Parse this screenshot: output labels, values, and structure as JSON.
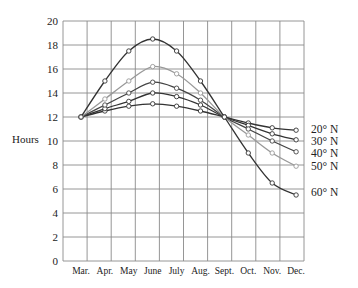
{
  "chart_data": {
    "type": "line",
    "title": "",
    "xlabel": "",
    "ylabel": "Hours",
    "ylim": [
      0,
      20
    ],
    "yticks": [
      0,
      2,
      4,
      6,
      8,
      10,
      12,
      14,
      16,
      18,
      20
    ],
    "grid": true,
    "legend_position": "right, inline labels at line ends",
    "categories": [
      "Mar.",
      "Apr.",
      "May",
      "June",
      "July",
      "Aug.",
      "Sept.",
      "Oct.",
      "Nov.",
      "Dec."
    ],
    "series": [
      {
        "name": "20° N",
        "color": "#333333",
        "values": [
          12,
          12.5,
          12.9,
          13.1,
          12.9,
          12.5,
          12,
          11.5,
          11.1,
          10.9
        ]
      },
      {
        "name": "30° N",
        "color": "#333333",
        "values": [
          12,
          12.7,
          13.3,
          14.0,
          13.7,
          13.0,
          12,
          11.3,
          10.6,
          10.1
        ]
      },
      {
        "name": "40° N",
        "color": "#444444",
        "values": [
          12,
          13.0,
          14.0,
          14.9,
          14.4,
          13.4,
          12,
          11.0,
          10.0,
          9.1
        ]
      },
      {
        "name": "50° N",
        "color": "#999999",
        "values": [
          12,
          13.5,
          15.0,
          16.2,
          15.6,
          14.0,
          12,
          10.5,
          9.0,
          7.9
        ]
      },
      {
        "name": "60° N",
        "color": "#333333",
        "values": [
          12,
          15.0,
          17.5,
          18.5,
          17.5,
          15.0,
          12,
          9.0,
          6.5,
          5.5
        ]
      }
    ]
  },
  "labels": {
    "ylabel": "Hours",
    "legend": [
      "20° N",
      "30° N",
      "40° N",
      "50° N",
      "60° N"
    ]
  }
}
